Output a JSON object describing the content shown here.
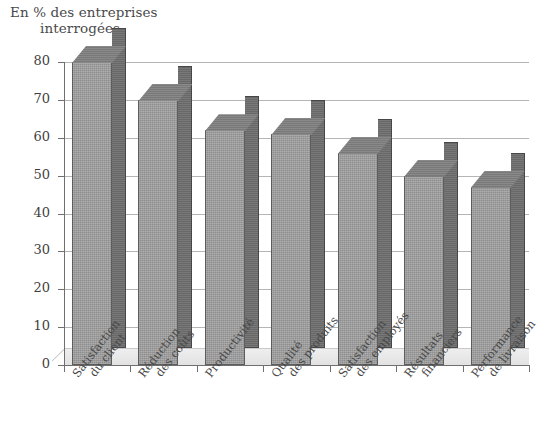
{
  "chart_data": {
    "type": "bar",
    "title": "En % des entreprises interrogées",
    "title_line1": "En % des entreprises",
    "title_line2": "interrogées",
    "xlabel": "",
    "ylabel": "En % des entreprises interrogées",
    "ylim": [
      0,
      80
    ],
    "ytick_labels": [
      "0",
      "10",
      "20",
      "30",
      "40",
      "50",
      "60",
      "70",
      "80"
    ],
    "ytick_values": [
      0,
      10,
      20,
      30,
      40,
      50,
      60,
      70,
      80
    ],
    "grid": true,
    "legend": "none",
    "style": "3d-bar",
    "categories": [
      "Satisfaction du client",
      "Réduction des coûts",
      "Productivité",
      "Qualité des produits",
      "Satisfaction des employés",
      "Résultats financiers",
      "Performance de livraison"
    ],
    "category_lines": [
      [
        "Satisfaction",
        "du client"
      ],
      [
        "Réduction",
        "des coûts"
      ],
      [
        "Productivité",
        ""
      ],
      [
        "Qualité",
        "des produits"
      ],
      [
        "Satisfaction",
        "des employés"
      ],
      [
        "Résultats",
        "financiers"
      ],
      [
        "Performance",
        "de livraison"
      ]
    ],
    "values": [
      80,
      70,
      62,
      61,
      56,
      50,
      47
    ]
  },
  "colors": {
    "bar_front": "#9c9c9c",
    "bar_side": "#6e6e6e",
    "bar_top": "#7f7f7f",
    "grid": "#b5b5b5",
    "axis": "#6f6f6f",
    "text": "#484848",
    "background": "#ffffff"
  }
}
